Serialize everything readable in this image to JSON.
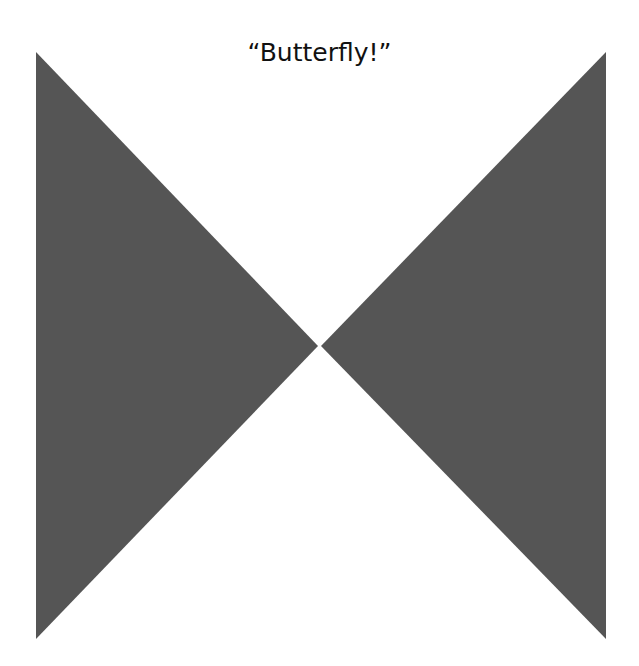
{
  "title": "“Butterfly!”",
  "shapes": {
    "fill_color": "#555555",
    "left_triangle": {
      "points": "36,52 36,639 318,346"
    },
    "right_triangle": {
      "points": "606,52 606,639 321,346"
    }
  }
}
